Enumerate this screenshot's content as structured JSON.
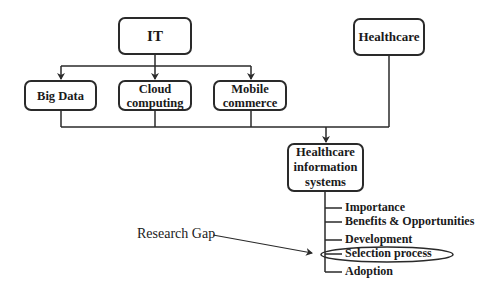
{
  "diagram": {
    "nodes": {
      "it": {
        "label": "IT"
      },
      "healthcare": {
        "label": "Healthcare"
      },
      "big_data": {
        "label": "Big Data"
      },
      "cloud": {
        "line1": "Cloud",
        "line2": "computing"
      },
      "mobile": {
        "line1": "Mobile",
        "line2": "commerce"
      },
      "his": {
        "line1": "Healthcare",
        "line2": "information",
        "line3": "systems"
      }
    },
    "his_aspects": [
      "Importance",
      "Benefits & Opportunities",
      "Development",
      "Selection process",
      "Adoption"
    ],
    "highlighted_aspect": "Selection process",
    "annotation": {
      "label": "Research Gap",
      "points_to": "Selection process"
    },
    "edges": [
      {
        "from": "IT",
        "to": "Big Data"
      },
      {
        "from": "IT",
        "to": "Cloud computing"
      },
      {
        "from": "IT",
        "to": "Mobile commerce"
      },
      {
        "from": "Big Data",
        "to": "Healthcare information systems"
      },
      {
        "from": "Cloud computing",
        "to": "Healthcare information systems"
      },
      {
        "from": "Mobile commerce",
        "to": "Healthcare information systems"
      },
      {
        "from": "Healthcare",
        "to": "Healthcare information systems"
      }
    ]
  }
}
